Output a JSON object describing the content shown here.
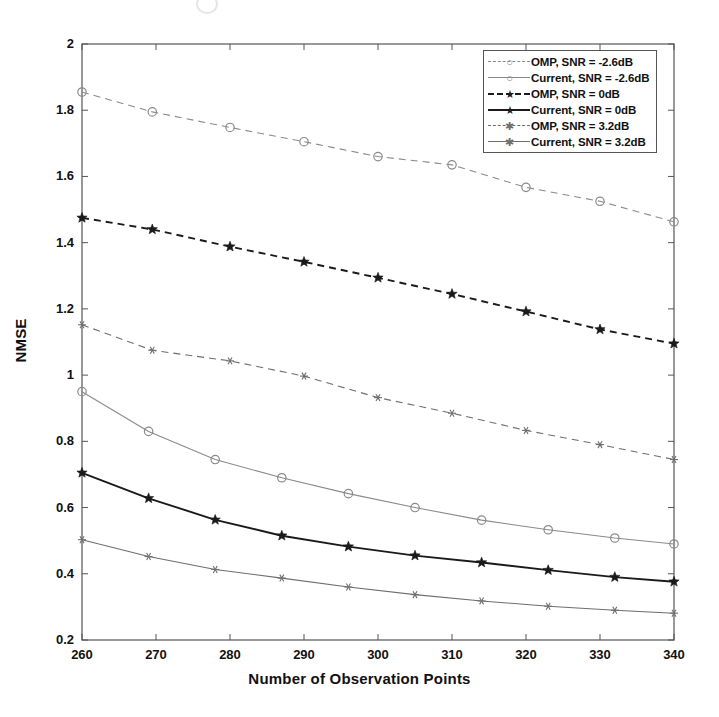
{
  "figure": {
    "background": "#ffffff",
    "plot_frame_color": "#555555"
  },
  "chart_data": {
    "type": "line",
    "title": "",
    "xlabel": "Number of Observation Points",
    "ylabel": "NMSE",
    "xlim": [
      260,
      340
    ],
    "ylim": [
      0.2,
      2
    ],
    "xticks": [
      260,
      270,
      280,
      290,
      300,
      310,
      320,
      330,
      340
    ],
    "yticks": [
      0.2,
      0.4,
      0.6,
      0.8,
      1,
      1.2,
      1.4,
      1.6,
      1.8,
      2
    ],
    "grid": false,
    "legend_position": "upper right",
    "series": [
      {
        "name": "OMP, SNR = -2.6dB",
        "linestyle": "dashed",
        "marker": "circle",
        "color": "#8a8a8a",
        "x": [
          260,
          269.5,
          280,
          290,
          300,
          310,
          320,
          330,
          340
        ],
        "y": [
          1.855,
          1.795,
          1.748,
          1.705,
          1.66,
          1.635,
          1.567,
          1.525,
          1.463
        ]
      },
      {
        "name": "Current, SNR = -2.6dB",
        "linestyle": "solid",
        "marker": "circle",
        "color": "#8a8a8a",
        "x": [
          260,
          269,
          278,
          287,
          296,
          305,
          314,
          323,
          332,
          340
        ],
        "y": [
          0.95,
          0.83,
          0.745,
          0.69,
          0.642,
          0.6,
          0.562,
          0.533,
          0.508,
          0.49
        ]
      },
      {
        "name": "OMP, SNR = 0dB",
        "linestyle": "dashed",
        "marker": "star",
        "color": "#1a1a1a",
        "x": [
          260,
          269.5,
          280,
          290,
          300,
          310,
          320,
          330,
          340
        ],
        "y": [
          1.475,
          1.44,
          1.388,
          1.342,
          1.294,
          1.245,
          1.192,
          1.138,
          1.095
        ]
      },
      {
        "name": "Current, SNR = 0dB",
        "linestyle": "solid",
        "marker": "star",
        "color": "#1a1a1a",
        "x": [
          260,
          269,
          278,
          287,
          296,
          305,
          314,
          323,
          332,
          340
        ],
        "y": [
          0.705,
          0.628,
          0.563,
          0.515,
          0.482,
          0.455,
          0.434,
          0.411,
          0.39,
          0.376
        ]
      },
      {
        "name": "OMP, SNR = 3.2dB",
        "linestyle": "dashed",
        "marker": "asterisk",
        "color": "#6e6e6e",
        "x": [
          260,
          269.5,
          280,
          290,
          300,
          310,
          320,
          330,
          340
        ],
        "y": [
          1.152,
          1.075,
          1.043,
          0.997,
          0.932,
          0.885,
          0.833,
          0.79,
          0.745
        ]
      },
      {
        "name": "Current, SNR = 3.2dB",
        "linestyle": "solid",
        "marker": "asterisk",
        "color": "#6e6e6e",
        "x": [
          260,
          269,
          278,
          287,
          296,
          305,
          314,
          323,
          332,
          340
        ],
        "y": [
          0.503,
          0.452,
          0.413,
          0.387,
          0.36,
          0.337,
          0.318,
          0.302,
          0.29,
          0.281
        ]
      }
    ]
  },
  "legend": {
    "entries": [
      {
        "label": "OMP, SNR = -2.6dB",
        "marker": "circle",
        "linestyle": "dashed",
        "color": "#8a8a8a"
      },
      {
        "label": "Current, SNR = -2.6dB",
        "marker": "circle",
        "linestyle": "solid",
        "color": "#8a8a8a"
      },
      {
        "label": "OMP, SNR = 0dB",
        "marker": "star",
        "linestyle": "dashed",
        "color": "#1a1a1a"
      },
      {
        "label": "Current, SNR = 0dB",
        "marker": "star",
        "linestyle": "solid",
        "color": "#1a1a1a"
      },
      {
        "label": "OMP, SNR = 3.2dB",
        "marker": "asterisk",
        "linestyle": "dashed",
        "color": "#6e6e6e"
      },
      {
        "label": "Current, SNR = 3.2dB",
        "marker": "asterisk",
        "linestyle": "solid",
        "color": "#6e6e6e"
      }
    ]
  }
}
